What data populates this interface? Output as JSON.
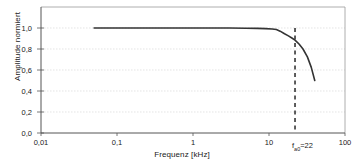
{
  "chart_data": {
    "type": "line",
    "title": "",
    "xlabel": "Frequenz [kHz]",
    "ylabel": "Amplitude normiert",
    "xscale": "log",
    "yscale": "linear",
    "xlim": [
      0.01,
      100
    ],
    "ylim": [
      0.0,
      1.0
    ],
    "grid": true,
    "legend": null,
    "xticks": [
      {
        "value": 0.01,
        "label": "0,01"
      },
      {
        "value": 0.1,
        "label": "0,1"
      },
      {
        "value": 1,
        "label": "1"
      },
      {
        "value": 10,
        "label": "10"
      },
      {
        "value": 100,
        "label": "100"
      }
    ],
    "yticks": [
      {
        "value": 0.0,
        "label": "0,0"
      },
      {
        "value": 0.2,
        "label": "0,2"
      },
      {
        "value": 0.4,
        "label": "0,4"
      },
      {
        "value": 0.6,
        "label": "0,6"
      },
      {
        "value": 0.8,
        "label": "0,8"
      },
      {
        "value": 1.0,
        "label": "1,0"
      }
    ],
    "series": [
      {
        "name": "Amplitudengang",
        "color": "#333333",
        "x": [
          0.05,
          0.1,
          0.3,
          1.0,
          3.0,
          5.0,
          7.0,
          9.0,
          11.0,
          12.5,
          14.0,
          16.0,
          18.0,
          20.0,
          22.0,
          25.0,
          28.0,
          32.0,
          36.0,
          40.0
        ],
        "y": [
          1.0,
          1.0,
          1.0,
          1.0,
          1.0,
          0.998,
          0.996,
          0.994,
          0.99,
          0.985,
          0.97,
          0.945,
          0.925,
          0.905,
          0.885,
          0.845,
          0.8,
          0.725,
          0.625,
          0.5
        ]
      }
    ],
    "annotations": [
      {
        "name": "cutoff-marker",
        "type": "vline",
        "x": 22,
        "style": "dashed",
        "color": "#1a1a1a",
        "label_prefix": "f",
        "label_sub": "a0",
        "label_suffix": "=22"
      }
    ]
  }
}
